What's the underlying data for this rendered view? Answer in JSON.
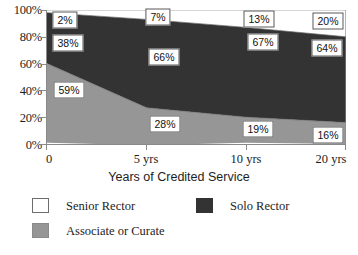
{
  "chart_data": {
    "type": "area",
    "stacked": true,
    "normalized_percent": true,
    "title": "",
    "xlabel": "Years of Credited Service",
    "ylabel": "",
    "categories": [
      "0",
      "5 yrs",
      "10 yrs",
      "20 yrs"
    ],
    "x_tick_labels": [
      "0",
      "5 yrs",
      "10 yrs",
      "20 yrs"
    ],
    "y_tick_labels": [
      "100%",
      "80%",
      "60%",
      "40%",
      "20%",
      "0%"
    ],
    "y_tick_values": [
      100,
      80,
      60,
      40,
      20,
      0
    ],
    "ylim": [
      0,
      100
    ],
    "grid": false,
    "legend_position": "bottom",
    "series": [
      {
        "name": "Senior Rector",
        "color": "#ffffff",
        "values": [
          2,
          7,
          13,
          20
        ],
        "labels": [
          "2%",
          "7%",
          "13%",
          "20%"
        ]
      },
      {
        "name": "Solo Rector",
        "color": "#333333",
        "values": [
          38,
          66,
          67,
          64
        ],
        "labels": [
          "38%",
          "66%",
          "67%",
          "64%"
        ]
      },
      {
        "name": "Associate or Curate",
        "color": "#969696",
        "values": [
          59,
          28,
          19,
          16
        ],
        "labels": [
          "59%",
          "28%",
          "19%",
          "16%"
        ]
      }
    ],
    "annotations": [
      {
        "text": "2%",
        "series": "Senior Rector",
        "category": "0"
      },
      {
        "text": "7%",
        "series": "Senior Rector",
        "category": "5 yrs"
      },
      {
        "text": "13%",
        "series": "Senior Rector",
        "category": "10 yrs"
      },
      {
        "text": "20%",
        "series": "Senior Rector",
        "category": "20 yrs"
      },
      {
        "text": "38%",
        "series": "Solo Rector",
        "category": "0"
      },
      {
        "text": "66%",
        "series": "Solo Rector",
        "category": "5 yrs"
      },
      {
        "text": "67%",
        "series": "Solo Rector",
        "category": "10 yrs"
      },
      {
        "text": "64%",
        "series": "Solo Rector",
        "category": "20 yrs"
      },
      {
        "text": "59%",
        "series": "Associate or Curate",
        "category": "0"
      },
      {
        "text": "28%",
        "series": "Associate or Curate",
        "category": "5 yrs"
      },
      {
        "text": "19%",
        "series": "Associate or Curate",
        "category": "10 yrs"
      },
      {
        "text": "16%",
        "series": "Associate or Curate",
        "category": "20 yrs"
      }
    ]
  },
  "axis": {
    "y": {
      "t0": "100%",
      "t1": "80%",
      "t2": "60%",
      "t3": "40%",
      "t4": "20%",
      "t5": "0%"
    },
    "x": {
      "t0": "0",
      "t1": "5 yrs",
      "t2": "10 yrs",
      "t3": "20 yrs",
      "title": "Years of Credited Service"
    }
  },
  "labels": {
    "sr_0": "2%",
    "sr_1": "7%",
    "sr_2": "13%",
    "sr_3": "20%",
    "so_0": "38%",
    "so_1": "66%",
    "so_2": "67%",
    "so_3": "64%",
    "ac_0": "59%",
    "ac_1": "28%",
    "ac_2": "19%",
    "ac_3": "16%"
  },
  "legend": {
    "items": [
      {
        "label": "Senior Rector",
        "color": "#ffffff"
      },
      {
        "label": "Solo Rector",
        "color": "#333333"
      },
      {
        "label": "Associate or Curate",
        "color": "#969696"
      }
    ]
  },
  "colors": {
    "senior_rector": "#ffffff",
    "solo_rector": "#333333",
    "associate_or_curate": "#969696",
    "axis": "#8a8a8a",
    "text": "#1d1d1d"
  }
}
